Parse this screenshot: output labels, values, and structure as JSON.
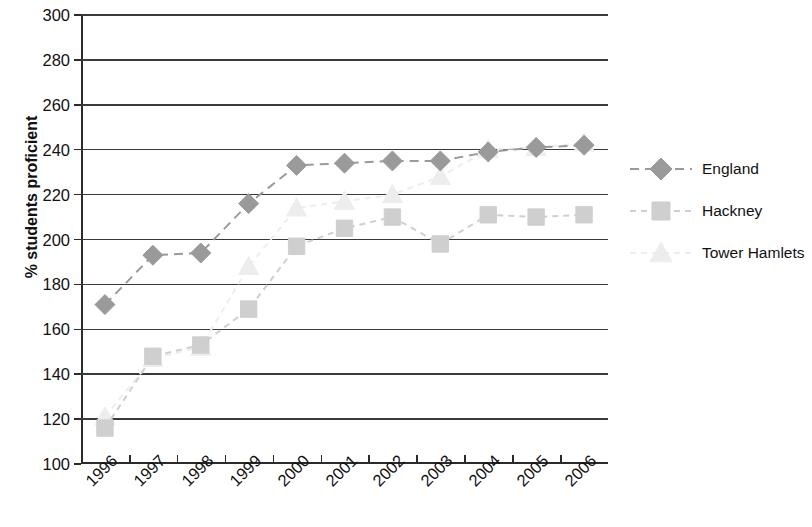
{
  "chart_data": {
    "type": "line",
    "title": "",
    "xlabel": "",
    "ylabel": "% students proficient",
    "categories": [
      "1996",
      "1997",
      "1998",
      "1999",
      "2000",
      "2001",
      "2002",
      "2003",
      "2004",
      "2005",
      "2006"
    ],
    "ylim": [
      100,
      300
    ],
    "ytick_step": 20,
    "yticks": [
      100,
      120,
      140,
      160,
      180,
      200,
      220,
      240,
      260,
      280,
      300
    ],
    "grid": "horizontal",
    "legend_position": "right",
    "series": [
      {
        "name": "England",
        "marker": "diamond",
        "color": "#9a9a9a",
        "line_style": "dashed",
        "values": [
          171,
          193,
          194,
          216,
          233,
          234,
          235,
          235,
          239,
          241,
          242
        ]
      },
      {
        "name": "Hackney",
        "marker": "square",
        "color": "#cfcfcf",
        "line_style": "dotted",
        "values": [
          116,
          148,
          153,
          169,
          197,
          205,
          210,
          198,
          211,
          210,
          211
        ]
      },
      {
        "name": "Tower Hamlets",
        "marker": "triangle",
        "color": "#ededed",
        "line_style": "dotted",
        "values": [
          121,
          147,
          152,
          188,
          214,
          217,
          220,
          228,
          240,
          241,
          243
        ]
      }
    ]
  },
  "legend": {
    "entries": [
      {
        "label": "England"
      },
      {
        "label": "Hackney"
      },
      {
        "label": "Tower Hamlets"
      }
    ]
  }
}
